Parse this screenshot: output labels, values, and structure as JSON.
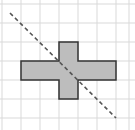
{
  "diagram": {
    "type": "grid-symmetry",
    "grid": {
      "x_lines": [
        2,
        21,
        40,
        59,
        78,
        97,
        116,
        129
      ],
      "y_lines": [
        4,
        23,
        42,
        61,
        80,
        99,
        118
      ],
      "color": "#d9d9d9"
    },
    "shape": {
      "points": "59,42 78,42 78,61 116,61 116,80 78,80 78,99 59,99 59,80 21,80 21,61 59,61",
      "fill": "#bdbdbd",
      "stroke": "#333333"
    },
    "line": {
      "x1": 10,
      "y1": 13,
      "x2": 116,
      "y2": 118,
      "color": "#555555",
      "dash": "4,3"
    }
  }
}
